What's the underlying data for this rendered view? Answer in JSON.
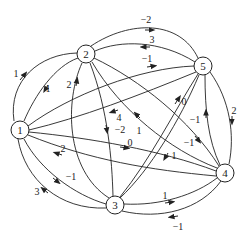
{
  "graph": {
    "type": "directed-weighted",
    "nodes": [
      {
        "id": "1",
        "label": "1",
        "x": 20,
        "y": 130
      },
      {
        "id": "2",
        "label": "2",
        "x": 86,
        "y": 54
      },
      {
        "id": "3",
        "label": "3",
        "x": 115,
        "y": 205
      },
      {
        "id": "4",
        "label": "4",
        "x": 225,
        "y": 173
      },
      {
        "id": "5",
        "label": "5",
        "x": 203,
        "y": 66
      }
    ],
    "edges": [
      {
        "from": "1",
        "to": "2",
        "weight": "1"
      },
      {
        "from": "2",
        "to": "1",
        "weight": "1"
      },
      {
        "from": "3",
        "to": "2",
        "weight": "2"
      },
      {
        "from": "2",
        "to": "5",
        "weight": "−2"
      },
      {
        "from": "5",
        "to": "2",
        "weight": "3"
      },
      {
        "from": "1",
        "to": "5",
        "weight": "−1"
      },
      {
        "from": "5",
        "to": "1",
        "weight": "4"
      },
      {
        "from": "2",
        "to": "3",
        "weight": "−2"
      },
      {
        "from": "4",
        "to": "2",
        "weight": "1"
      },
      {
        "from": "1",
        "to": "4",
        "weight": "0"
      },
      {
        "from": "3",
        "to": "5",
        "weight": "0"
      },
      {
        "from": "2",
        "to": "4",
        "weight": "−1"
      },
      {
        "from": "4",
        "to": "5",
        "weight": "−1"
      },
      {
        "from": "5",
        "to": "4",
        "weight": "2"
      },
      {
        "from": "5",
        "to": "3",
        "weight": "1"
      },
      {
        "from": "4",
        "to": "1",
        "weight": "2"
      },
      {
        "from": "1",
        "to": "3",
        "weight": "−1"
      },
      {
        "from": "3",
        "to": "1",
        "weight": "3"
      },
      {
        "from": "3",
        "to": "4",
        "weight": "1"
      },
      {
        "from": "4",
        "to": "3",
        "weight": "−1"
      }
    ]
  },
  "labels": {
    "n1": "1",
    "n2": "2",
    "n3": "3",
    "n4": "4",
    "n5": "5",
    "e12": "1",
    "e21": "1",
    "e32": "2",
    "e25": "−2",
    "e52": "3",
    "e15": "−1",
    "e51": "4",
    "e23": "−2",
    "e42": "1",
    "e14": "0",
    "e35": "0",
    "e24": "−1",
    "e45": "−1",
    "e54": "2",
    "e53": "1",
    "e41": "2",
    "e13": "−1",
    "e31": "3",
    "e34": "1",
    "e43": "−1"
  },
  "colors": {
    "stroke": "#222222",
    "background": "#ffffff"
  }
}
